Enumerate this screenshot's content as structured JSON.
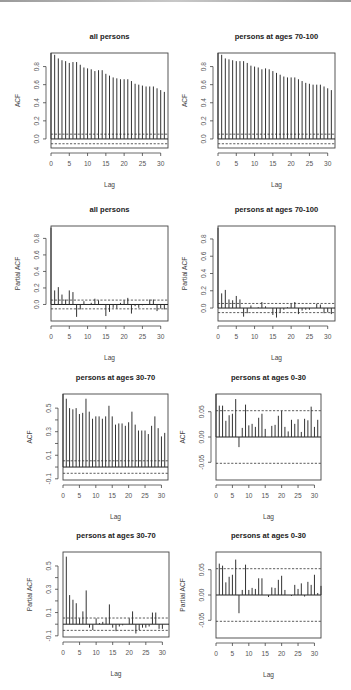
{
  "chart_data": [
    {
      "id": "p1",
      "type": "bar",
      "subtype": "acf",
      "title": "all persons",
      "xlabel": "Lag",
      "ylabel": "ACF",
      "lags": [
        0,
        1,
        2,
        3,
        4,
        5,
        6,
        7,
        8,
        9,
        10,
        11,
        12,
        13,
        14,
        15,
        16,
        17,
        18,
        19,
        20,
        21,
        22,
        23,
        24,
        25,
        26,
        27,
        28,
        29,
        30,
        31,
        32
      ],
      "values": [
        1.0,
        0.93,
        0.89,
        0.87,
        0.86,
        0.84,
        0.85,
        0.85,
        0.82,
        0.79,
        0.78,
        0.77,
        0.75,
        0.76,
        0.76,
        0.72,
        0.7,
        0.68,
        0.67,
        0.66,
        0.66,
        0.66,
        0.64,
        0.61,
        0.6,
        0.59,
        0.58,
        0.58,
        0.58,
        0.56,
        0.54,
        0.52
      ],
      "ci": 0.053,
      "xlim": [
        0,
        32
      ],
      "ylim": [
        -0.1,
        0.95
      ],
      "xticks": [
        0,
        5,
        10,
        15,
        20,
        25,
        30
      ],
      "yticks": [
        0.0,
        0.2,
        0.4,
        0.6,
        0.8
      ],
      "ytick_labels": [
        "0.0",
        "0.2",
        "0.4",
        "0.6",
        "0.8"
      ],
      "frame": {
        "x": 51,
        "y": 53,
        "w": 117,
        "h": 95
      },
      "panel_pos": {
        "left": 0,
        "top": 0
      }
    },
    {
      "id": "p2",
      "type": "bar",
      "subtype": "acf",
      "title": "persons at ages 70-100",
      "xlabel": "Lag",
      "ylabel": "ACF",
      "values": [
        1.0,
        0.93,
        0.89,
        0.88,
        0.87,
        0.86,
        0.86,
        0.86,
        0.84,
        0.81,
        0.8,
        0.79,
        0.77,
        0.78,
        0.77,
        0.75,
        0.73,
        0.71,
        0.69,
        0.68,
        0.68,
        0.68,
        0.66,
        0.64,
        0.62,
        0.61,
        0.6,
        0.6,
        0.6,
        0.58,
        0.56,
        0.54
      ],
      "ci": 0.053,
      "xlim": [
        0,
        32
      ],
      "ylim": [
        -0.1,
        0.95
      ],
      "xticks": [
        0,
        5,
        10,
        15,
        20,
        25,
        30
      ],
      "yticks": [
        0.0,
        0.2,
        0.4,
        0.6,
        0.8
      ],
      "ytick_labels": [
        "0.0",
        "0.2",
        "0.4",
        "0.6",
        "0.8"
      ],
      "frame": {
        "x": 42,
        "y": 53,
        "w": 117,
        "h": 95
      },
      "panel_pos": {
        "left": 176,
        "top": 0
      }
    },
    {
      "id": "p3",
      "type": "bar",
      "subtype": "pacf",
      "title": "all persons",
      "xlabel": "Lag",
      "ylabel": "Partial ACF",
      "values": [
        0.93,
        0.17,
        0.21,
        0.12,
        0.06,
        0.17,
        0.15,
        -0.15,
        -0.06,
        0.04,
        0.0,
        0.02,
        0.07,
        0.05,
        0.0,
        -0.14,
        -0.09,
        -0.04,
        -0.05,
        0.02,
        0.05,
        0.08,
        -0.11,
        -0.02,
        -0.04,
        -0.01,
        0.0,
        0.06,
        0.06,
        -0.08,
        -0.05,
        -0.06
      ],
      "ci": 0.053,
      "xlim": [
        0,
        32
      ],
      "ylim": [
        -0.2,
        0.95
      ],
      "xticks": [
        0,
        5,
        10,
        15,
        20,
        25,
        30
      ],
      "yticks": [
        0.0,
        0.2,
        0.4,
        0.6,
        0.8
      ],
      "ytick_labels": [
        "0.0",
        "0.2",
        "0.4",
        "0.6",
        "0.8"
      ],
      "frame": {
        "x": 51,
        "y": 51,
        "w": 117,
        "h": 95
      },
      "panel_pos": {
        "left": 0,
        "top": 175
      }
    },
    {
      "id": "p4",
      "type": "bar",
      "subtype": "pacf",
      "title": "persons at ages 70-100",
      "xlabel": "Lag",
      "ylabel": "Partial ACF",
      "values": [
        0.93,
        0.17,
        0.21,
        0.1,
        0.09,
        0.14,
        0.1,
        -0.1,
        -0.06,
        0.03,
        0.0,
        0.01,
        0.07,
        0.02,
        0.0,
        -0.08,
        -0.11,
        -0.05,
        -0.02,
        0.01,
        0.05,
        0.07,
        -0.07,
        -0.03,
        -0.02,
        -0.02,
        0.0,
        0.05,
        0.04,
        -0.06,
        -0.05,
        -0.07
      ],
      "ci": 0.053,
      "xlim": [
        0,
        32
      ],
      "ylim": [
        -0.15,
        0.95
      ],
      "xticks": [
        0,
        5,
        10,
        15,
        20,
        25,
        30
      ],
      "yticks": [
        0.0,
        0.2,
        0.4,
        0.6,
        0.8
      ],
      "ytick_labels": [
        "0.0",
        "0.2",
        "0.4",
        "0.6",
        "0.8"
      ],
      "frame": {
        "x": 42,
        "y": 51,
        "w": 117,
        "h": 95
      },
      "panel_pos": {
        "left": 176,
        "top": 175
      }
    },
    {
      "id": "p5",
      "type": "bar",
      "subtype": "acf",
      "title": "persons at ages 30-70",
      "xlabel": "Lag",
      "ylabel": "ACF",
      "values": [
        1.0,
        0.58,
        0.5,
        0.49,
        0.5,
        0.45,
        0.46,
        0.58,
        0.47,
        0.41,
        0.43,
        0.43,
        0.41,
        0.43,
        0.52,
        0.43,
        0.36,
        0.37,
        0.37,
        0.35,
        0.38,
        0.47,
        0.36,
        0.31,
        0.31,
        0.31,
        0.28,
        0.35,
        0.43,
        0.33,
        0.26,
        0.29
      ],
      "ci": 0.053,
      "xlim": [
        0,
        32
      ],
      "ylim": [
        -0.11,
        0.62
      ],
      "xticks": [
        0,
        5,
        10,
        15,
        20,
        25,
        30
      ],
      "yticks": [
        -0.1,
        0.1,
        0.3,
        0.5
      ],
      "ytick_labels": [
        "-0.1",
        "0.1",
        "0.3",
        "0.5"
      ],
      "minor_yticks": [
        0.0,
        0.2,
        0.4
      ],
      "frame": {
        "x": 63,
        "y": 49,
        "w": 105,
        "h": 86
      },
      "panel_pos": {
        "left": 0,
        "top": 345
      }
    },
    {
      "id": "p6",
      "type": "bar",
      "subtype": "acf",
      "title": "persons at ages 0-30",
      "xlabel": "Lag",
      "ylabel": "ACF",
      "values": [
        1.0,
        0.062,
        0.062,
        0.032,
        0.043,
        0.046,
        0.075,
        -0.02,
        0.018,
        0.064,
        0.023,
        0.026,
        0.02,
        0.038,
        0.046,
        0.016,
        0.0,
        0.022,
        0.024,
        0.042,
        0.052,
        0.02,
        0.011,
        0.034,
        0.026,
        0.035,
        0.01,
        0.036,
        0.033,
        0.06,
        0.02,
        0.034
      ],
      "ci": 0.052,
      "xlim": [
        0,
        32
      ],
      "ylim": [
        -0.085,
        0.085
      ],
      "clip_lag0": true,
      "xticks": [
        0,
        5,
        10,
        15,
        20,
        25,
        30
      ],
      "yticks": [
        -0.05,
        0.0,
        0.05
      ],
      "ytick_labels": [
        "-0.05",
        "0.00",
        "0.05"
      ],
      "frame": {
        "x": 40,
        "y": 49,
        "w": 105,
        "h": 86
      },
      "panel_pos": {
        "left": 176,
        "top": 345
      }
    },
    {
      "id": "p7",
      "type": "bar",
      "subtype": "pacf",
      "title": "persons at ages 30-70",
      "xlabel": "Lag",
      "ylabel": "Partial ACF",
      "values": [
        0.58,
        0.25,
        0.21,
        0.18,
        0.05,
        0.11,
        0.29,
        -0.03,
        -0.05,
        0.05,
        0.01,
        0.02,
        0.05,
        0.17,
        -0.03,
        -0.06,
        -0.02,
        -0.01,
        0.0,
        0.05,
        0.11,
        -0.08,
        -0.05,
        -0.03,
        -0.03,
        -0.02,
        0.1,
        0.1,
        -0.04,
        -0.04,
        0.0
      ],
      "lag_start": 1,
      "ci": 0.053,
      "xlim": [
        0,
        32
      ],
      "ylim": [
        -0.11,
        0.62
      ],
      "xticks": [
        0,
        5,
        10,
        15,
        20,
        25,
        30
      ],
      "yticks": [
        -0.1,
        0.1,
        0.3,
        0.5
      ],
      "ytick_labels": [
        "-0.1",
        "0.1",
        "0.3",
        "0.5"
      ],
      "minor_yticks": [
        0.0,
        0.2,
        0.4
      ],
      "frame": {
        "x": 63,
        "y": 37,
        "w": 106,
        "h": 85
      },
      "panel_pos": {
        "left": 0,
        "top": 515
      }
    },
    {
      "id": "p8",
      "type": "bar",
      "subtype": "pacf",
      "title": "persons at ages 0-30",
      "xlabel": "Lag",
      "ylabel": "Partial ACF",
      "values": [
        0.062,
        0.058,
        0.025,
        0.036,
        0.04,
        0.07,
        -0.036,
        0.01,
        0.06,
        0.01,
        0.014,
        0.012,
        0.033,
        0.033,
        0.0,
        -0.004,
        0.015,
        0.014,
        0.03,
        0.038,
        0.01,
        0.0,
        -0.002,
        0.02,
        0.012,
        0.023,
        -0.003,
        0.026,
        0.02,
        0.04,
        0.004,
        0.018
      ],
      "lag_start": 1,
      "ci": 0.052,
      "xlim": [
        0,
        32
      ],
      "ylim": [
        -0.085,
        0.085
      ],
      "xticks": [
        0,
        5,
        10,
        15,
        20,
        25,
        30
      ],
      "yticks": [
        -0.05,
        0.0,
        0.05
      ],
      "ytick_labels": [
        "-0.05",
        "0.00",
        "0.05"
      ],
      "frame": {
        "x": 40,
        "y": 37,
        "w": 105,
        "h": 86
      },
      "panel_pos": {
        "left": 176,
        "top": 515
      }
    }
  ]
}
